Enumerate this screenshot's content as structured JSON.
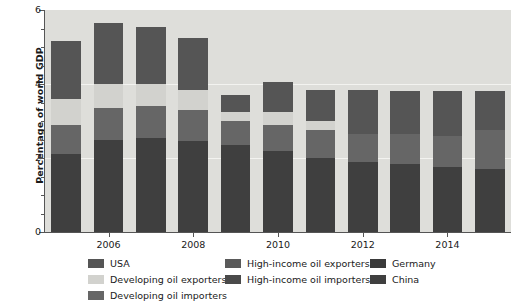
{
  "chart_data": {
    "type": "bar",
    "stacked": true,
    "title": "",
    "xlabel": "",
    "ylabel": "Percentage of world GDP",
    "ylim": [
      0,
      6
    ],
    "yticks": [
      0,
      2,
      4,
      6
    ],
    "ytick_labels": [
      "0",
      "2",
      "4",
      "6"
    ],
    "yminor_step": 0.5,
    "grid": true,
    "grid_values": [
      2,
      4
    ],
    "categories": [
      2005,
      2006,
      2007,
      2008,
      2009,
      2010,
      2011,
      2012,
      2013,
      2014,
      2015
    ],
    "xtick_labels": [
      "2006",
      "2008",
      "2010",
      "2012",
      "2014"
    ],
    "xtick_values": [
      2006,
      2008,
      2010,
      2012,
      2014
    ],
    "legend_position": "bottom",
    "series": [
      {
        "name": "China",
        "color": "#3f3f3f",
        "values": [
          2.1,
          2.5,
          2.55,
          2.45,
          2.35,
          2.2,
          2.0,
          1.9,
          1.85,
          1.75,
          1.7
        ]
      },
      {
        "name": "Developing oil importers",
        "color": "#666666",
        "values": [
          0.8,
          0.85,
          0.85,
          0.85,
          0.65,
          0.7,
          0.75,
          0.75,
          0.8,
          0.85,
          1.05
        ]
      },
      {
        "name": "Developing oil exporters",
        "color": "#d2d2ce",
        "values": [
          0.7,
          0.65,
          0.6,
          0.55,
          0.25,
          0.35,
          0.25,
          0.0,
          0.0,
          0.0,
          0.0
        ]
      },
      {
        "name": "High-income oil exporters",
        "color": "#5a5a5a",
        "values": [
          0.0,
          0.0,
          0.0,
          0.0,
          0.0,
          0.0,
          0.0,
          0.0,
          0.0,
          0.0,
          0.0
        ]
      },
      {
        "name": "High-income oil importers",
        "color": "#4a4a4a",
        "values": [
          0.0,
          0.0,
          0.0,
          0.0,
          0.0,
          0.0,
          0.0,
          0.0,
          0.0,
          0.0,
          0.0
        ]
      },
      {
        "name": "Germany",
        "color": "#3a3a3a",
        "values": [
          0.0,
          0.0,
          0.0,
          0.0,
          0.0,
          0.0,
          0.0,
          0.0,
          0.0,
          0.0,
          0.0
        ]
      },
      {
        "name": "USA",
        "color": "#555555",
        "values": [
          1.55,
          1.65,
          1.55,
          1.4,
          0.45,
          0.8,
          0.85,
          1.2,
          1.15,
          1.2,
          1.05
        ]
      }
    ],
    "totals": [
      5.15,
      5.65,
      5.55,
      5.25,
      3.7,
      4.05,
      3.85,
      3.85,
      3.8,
      3.8,
      3.8
    ],
    "bars": [
      {
        "year": 2005,
        "total": 5.15,
        "segments": [
          {
            "name": "China",
            "value": 2.1,
            "color": "#3f3f3f"
          },
          {
            "name": "Developing oil importers",
            "value": 0.8,
            "color": "#666666"
          },
          {
            "name": "Developing oil exporters",
            "value": 0.7,
            "color": "#d2d2ce"
          },
          {
            "name": "USA",
            "value": 1.55,
            "color": "#555555"
          }
        ]
      },
      {
        "year": 2006,
        "total": 5.65,
        "segments": [
          {
            "name": "China",
            "value": 2.5,
            "color": "#3f3f3f"
          },
          {
            "name": "Developing oil importers",
            "value": 0.85,
            "color": "#666666"
          },
          {
            "name": "Developing oil exporters",
            "value": 0.65,
            "color": "#d2d2ce"
          },
          {
            "name": "USA",
            "value": 1.65,
            "color": "#555555"
          }
        ]
      },
      {
        "year": 2007,
        "total": 5.55,
        "segments": [
          {
            "name": "China",
            "value": 2.55,
            "color": "#3f3f3f"
          },
          {
            "name": "Developing oil importers",
            "value": 0.85,
            "color": "#666666"
          },
          {
            "name": "Developing oil exporters",
            "value": 0.6,
            "color": "#d2d2ce"
          },
          {
            "name": "USA",
            "value": 1.55,
            "color": "#555555"
          }
        ]
      },
      {
        "year": 2008,
        "total": 5.25,
        "segments": [
          {
            "name": "China",
            "value": 2.45,
            "color": "#3f3f3f"
          },
          {
            "name": "Developing oil importers",
            "value": 0.85,
            "color": "#666666"
          },
          {
            "name": "Developing oil exporters",
            "value": 0.55,
            "color": "#d2d2ce"
          },
          {
            "name": "USA",
            "value": 1.4,
            "color": "#555555"
          }
        ]
      },
      {
        "year": 2009,
        "total": 3.7,
        "segments": [
          {
            "name": "China",
            "value": 2.35,
            "color": "#3f3f3f"
          },
          {
            "name": "Developing oil importers",
            "value": 0.65,
            "color": "#666666"
          },
          {
            "name": "Developing oil exporters",
            "value": 0.25,
            "color": "#d2d2ce"
          },
          {
            "name": "USA",
            "value": 0.45,
            "color": "#555555"
          }
        ]
      },
      {
        "year": 2010,
        "total": 4.05,
        "segments": [
          {
            "name": "China",
            "value": 2.2,
            "color": "#3f3f3f"
          },
          {
            "name": "Developing oil importers",
            "value": 0.7,
            "color": "#666666"
          },
          {
            "name": "Developing oil exporters",
            "value": 0.35,
            "color": "#d2d2ce"
          },
          {
            "name": "USA",
            "value": 0.8,
            "color": "#555555"
          }
        ]
      },
      {
        "year": 2011,
        "total": 3.85,
        "segments": [
          {
            "name": "China",
            "value": 2.0,
            "color": "#3f3f3f"
          },
          {
            "name": "Developing oil importers",
            "value": 0.75,
            "color": "#666666"
          },
          {
            "name": "Developing oil exporters",
            "value": 0.25,
            "color": "#d2d2ce"
          },
          {
            "name": "USA",
            "value": 0.85,
            "color": "#555555"
          }
        ]
      },
      {
        "year": 2012,
        "total": 3.85,
        "segments": [
          {
            "name": "China",
            "value": 1.9,
            "color": "#3f3f3f"
          },
          {
            "name": "Developing oil importers",
            "value": 0.75,
            "color": "#666666"
          },
          {
            "name": "USA",
            "value": 1.2,
            "color": "#555555"
          }
        ]
      },
      {
        "year": 2013,
        "total": 3.8,
        "segments": [
          {
            "name": "China",
            "value": 1.85,
            "color": "#3f3f3f"
          },
          {
            "name": "Developing oil importers",
            "value": 0.8,
            "color": "#666666"
          },
          {
            "name": "USA",
            "value": 1.15,
            "color": "#555555"
          }
        ]
      },
      {
        "year": 2014,
        "total": 3.8,
        "segments": [
          {
            "name": "China",
            "value": 1.75,
            "color": "#3f3f3f"
          },
          {
            "name": "Developing oil importers",
            "value": 0.85,
            "color": "#666666"
          },
          {
            "name": "USA",
            "value": 1.2,
            "color": "#555555"
          }
        ]
      },
      {
        "year": 2015,
        "total": 3.8,
        "segments": [
          {
            "name": "China",
            "value": 1.7,
            "color": "#3f3f3f"
          },
          {
            "name": "Developing oil importers",
            "value": 1.05,
            "color": "#666666"
          },
          {
            "name": "USA",
            "value": 1.05,
            "color": "#555555"
          }
        ]
      }
    ]
  },
  "legend": {
    "columns": [
      {
        "items": [
          {
            "label": "USA",
            "color": "#555555"
          },
          {
            "label": "Developing oil exporters",
            "color": "#d2d2ce"
          },
          {
            "label": "Developing oil importers",
            "color": "#666666"
          }
        ]
      },
      {
        "items": [
          {
            "label": "High-income oil exporters",
            "color": "#5a5a5a"
          },
          {
            "label": "High-income oil importers",
            "color": "#4a4a4a"
          }
        ]
      },
      {
        "items": [
          {
            "label": "Germany",
            "color": "#3a3a3a"
          },
          {
            "label": "China",
            "color": "#3f3f3f"
          }
        ]
      }
    ]
  },
  "style": {
    "plot_background": "#dededa",
    "page_background": "#ffffff",
    "axis_color": "#555555",
    "grid_color": "#f3f3f0",
    "text_color": "#1a1a1a"
  }
}
